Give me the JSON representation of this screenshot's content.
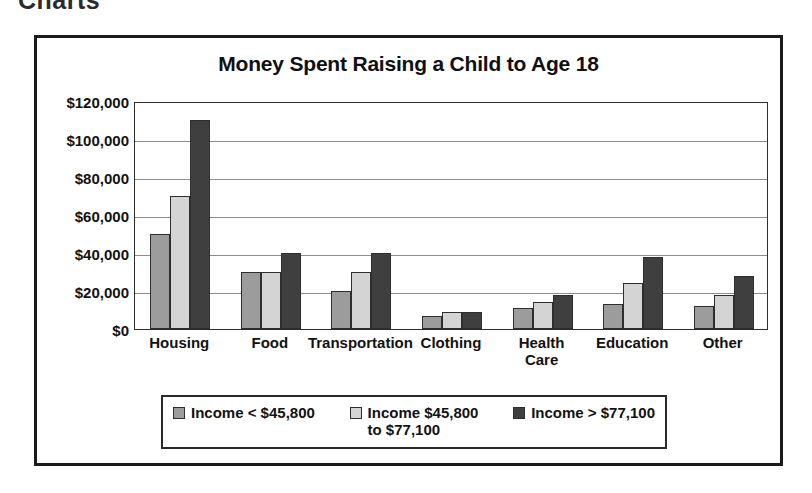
{
  "scan": {
    "top_cut_heading": "Charts",
    "right_bleed_text": "Weekly Breakdown of\nExpenditures"
  },
  "figure": {
    "title": "Money Spent Raising a Child to Age 18"
  },
  "legend": {
    "items": [
      {
        "label": "Income < $45,800",
        "color": "#9c9c9c",
        "swatch_name": "legend-swatch-low-income"
      },
      {
        "label": "Income $45,800\nto $77,100",
        "color": "#d4d4d4",
        "swatch_name": "legend-swatch-mid-income"
      },
      {
        "label": "Income > $77,100",
        "color": "#3f3f3f",
        "swatch_name": "legend-swatch-high-income"
      }
    ]
  },
  "axis": {
    "y_ticks": [
      "$0",
      "$20,000",
      "$40,000",
      "$60,000",
      "$80,000",
      "$100,000",
      "$120,000"
    ],
    "x_ticks": [
      "Housing",
      "Food",
      "Transportation",
      "Clothing",
      "Health\nCare",
      "Education",
      "Other"
    ]
  },
  "chart_data": {
    "type": "bar",
    "title": "Money Spent Raising a Child to Age 18",
    "xlabel": "",
    "ylabel": "",
    "ylim": [
      0,
      120000
    ],
    "ytick_step": 20000,
    "grid": true,
    "legend_position": "bottom",
    "categories": [
      "Housing",
      "Food",
      "Transportation",
      "Clothing",
      "Health Care",
      "Education",
      "Other"
    ],
    "series": [
      {
        "name": "Income < $45,800",
        "color": "#9c9c9c",
        "values": [
          50000,
          30000,
          20000,
          7000,
          11000,
          13000,
          12000
        ]
      },
      {
        "name": "Income $45,800 to $77,100",
        "color": "#d4d4d4",
        "values": [
          70000,
          30000,
          30000,
          9000,
          14000,
          24000,
          18000
        ]
      },
      {
        "name": "Income > $77,100",
        "color": "#3f3f3f",
        "values": [
          110000,
          40000,
          40000,
          9000,
          18000,
          38000,
          28000
        ]
      }
    ]
  }
}
